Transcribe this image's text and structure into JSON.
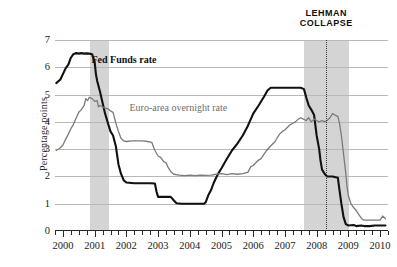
{
  "chart_data": {
    "type": "line",
    "title": "",
    "xlabel": "",
    "ylabel": "Percentage points",
    "xlim": [
      1999.75,
      2010.25
    ],
    "ylim": [
      0,
      7
    ],
    "ytick_labels": [
      "0",
      "1",
      "2",
      "3",
      "4",
      "5",
      "6",
      "7"
    ],
    "ytick_values": [
      0,
      1,
      2,
      3,
      4,
      5,
      6,
      7
    ],
    "xtick_labels": [
      "2000",
      "2001",
      "2002",
      "2003",
      "2004",
      "2005",
      "2006",
      "2007",
      "2008",
      "2009",
      "2010"
    ],
    "xtick_values": [
      2000,
      2001,
      2002,
      2003,
      2004,
      2005,
      2006,
      2007,
      2008,
      2009,
      2010
    ],
    "grid": true,
    "legend": "inline-labels",
    "series": [
      {
        "name": "Fed Funds rate",
        "color": "#111111",
        "label_x": 2000.9,
        "label_y": 6.25,
        "points": [
          [
            1999.79,
            5.42
          ],
          [
            1999.92,
            5.55
          ],
          [
            2000.0,
            5.75
          ],
          [
            2000.08,
            5.95
          ],
          [
            2000.17,
            6.1
          ],
          [
            2000.25,
            6.35
          ],
          [
            2000.33,
            6.48
          ],
          [
            2000.42,
            6.52
          ],
          [
            2000.5,
            6.5
          ],
          [
            2000.58,
            6.52
          ],
          [
            2000.67,
            6.5
          ],
          [
            2000.75,
            6.51
          ],
          [
            2000.83,
            6.5
          ],
          [
            2000.92,
            6.48
          ],
          [
            2001.0,
            6.2
          ],
          [
            2001.04,
            5.75
          ],
          [
            2001.08,
            5.5
          ],
          [
            2001.17,
            5.1
          ],
          [
            2001.25,
            4.7
          ],
          [
            2001.33,
            4.3
          ],
          [
            2001.42,
            3.95
          ],
          [
            2001.5,
            3.65
          ],
          [
            2001.58,
            3.5
          ],
          [
            2001.67,
            3.1
          ],
          [
            2001.75,
            2.45
          ],
          [
            2001.83,
            2.1
          ],
          [
            2001.92,
            1.85
          ],
          [
            2002.0,
            1.78
          ],
          [
            2002.25,
            1.75
          ],
          [
            2002.5,
            1.75
          ],
          [
            2002.75,
            1.75
          ],
          [
            2002.9,
            1.74
          ],
          [
            2002.95,
            1.45
          ],
          [
            2003.0,
            1.25
          ],
          [
            2003.1,
            1.25
          ],
          [
            2003.2,
            1.25
          ],
          [
            2003.4,
            1.25
          ],
          [
            2003.5,
            1.12
          ],
          [
            2003.58,
            1.02
          ],
          [
            2003.75,
            1.0
          ],
          [
            2004.0,
            1.0
          ],
          [
            2004.25,
            1.0
          ],
          [
            2004.45,
            1.0
          ],
          [
            2004.5,
            1.05
          ],
          [
            2004.58,
            1.3
          ],
          [
            2004.67,
            1.5
          ],
          [
            2004.75,
            1.75
          ],
          [
            2004.83,
            1.95
          ],
          [
            2004.92,
            2.15
          ],
          [
            2005.0,
            2.3
          ],
          [
            2005.17,
            2.65
          ],
          [
            2005.33,
            2.95
          ],
          [
            2005.5,
            3.2
          ],
          [
            2005.67,
            3.5
          ],
          [
            2005.83,
            3.85
          ],
          [
            2006.0,
            4.3
          ],
          [
            2006.17,
            4.6
          ],
          [
            2006.33,
            4.9
          ],
          [
            2006.45,
            5.15
          ],
          [
            2006.55,
            5.25
          ],
          [
            2006.75,
            5.25
          ],
          [
            2007.0,
            5.25
          ],
          [
            2007.25,
            5.25
          ],
          [
            2007.5,
            5.25
          ],
          [
            2007.6,
            5.2
          ],
          [
            2007.67,
            4.9
          ],
          [
            2007.75,
            4.6
          ],
          [
            2007.83,
            4.45
          ],
          [
            2007.92,
            4.25
          ],
          [
            2008.0,
            3.5
          ],
          [
            2008.08,
            3.0
          ],
          [
            2008.12,
            2.6
          ],
          [
            2008.17,
            2.25
          ],
          [
            2008.25,
            2.1
          ],
          [
            2008.33,
            2.0
          ],
          [
            2008.5,
            2.0
          ],
          [
            2008.67,
            1.95
          ],
          [
            2008.72,
            1.5
          ],
          [
            2008.78,
            1.0
          ],
          [
            2008.85,
            0.5
          ],
          [
            2008.92,
            0.25
          ],
          [
            2009.0,
            0.2
          ],
          [
            2009.17,
            0.22
          ],
          [
            2009.25,
            0.18
          ],
          [
            2009.4,
            0.2
          ],
          [
            2009.5,
            0.18
          ],
          [
            2009.67,
            0.18
          ],
          [
            2009.83,
            0.2
          ],
          [
            2010.0,
            0.2
          ],
          [
            2010.17,
            0.2
          ]
        ]
      },
      {
        "name": "Euro-area overnight rate",
        "color": "#7a7a7a",
        "label_x": 2002.1,
        "label_y": 4.5,
        "points": [
          [
            1999.79,
            2.95
          ],
          [
            1999.92,
            3.05
          ],
          [
            2000.0,
            3.15
          ],
          [
            2000.08,
            3.35
          ],
          [
            2000.17,
            3.55
          ],
          [
            2000.25,
            3.75
          ],
          [
            2000.33,
            3.9
          ],
          [
            2000.42,
            4.15
          ],
          [
            2000.5,
            4.35
          ],
          [
            2000.58,
            4.45
          ],
          [
            2000.67,
            4.6
          ],
          [
            2000.72,
            4.85
          ],
          [
            2000.78,
            4.78
          ],
          [
            2000.83,
            4.9
          ],
          [
            2000.92,
            4.85
          ],
          [
            2001.0,
            4.75
          ],
          [
            2001.08,
            4.78
          ],
          [
            2001.12,
            4.55
          ],
          [
            2001.17,
            4.6
          ],
          [
            2001.25,
            4.55
          ],
          [
            2001.33,
            4.5
          ],
          [
            2001.42,
            4.48
          ],
          [
            2001.5,
            4.4
          ],
          [
            2001.58,
            4.35
          ],
          [
            2001.67,
            3.95
          ],
          [
            2001.75,
            3.65
          ],
          [
            2001.83,
            3.4
          ],
          [
            2001.92,
            3.3
          ],
          [
            2002.0,
            3.28
          ],
          [
            2002.17,
            3.3
          ],
          [
            2002.33,
            3.3
          ],
          [
            2002.5,
            3.3
          ],
          [
            2002.67,
            3.28
          ],
          [
            2002.8,
            3.25
          ],
          [
            2002.9,
            2.95
          ],
          [
            2003.0,
            2.75
          ],
          [
            2003.08,
            2.7
          ],
          [
            2003.17,
            2.55
          ],
          [
            2003.25,
            2.5
          ],
          [
            2003.33,
            2.3
          ],
          [
            2003.42,
            2.15
          ],
          [
            2003.5,
            2.08
          ],
          [
            2003.67,
            2.05
          ],
          [
            2003.83,
            2.03
          ],
          [
            2004.0,
            2.05
          ],
          [
            2004.17,
            2.03
          ],
          [
            2004.33,
            2.05
          ],
          [
            2004.5,
            2.04
          ],
          [
            2004.67,
            2.05
          ],
          [
            2004.83,
            2.08
          ],
          [
            2005.0,
            2.1
          ],
          [
            2005.17,
            2.07
          ],
          [
            2005.33,
            2.1
          ],
          [
            2005.5,
            2.08
          ],
          [
            2005.67,
            2.1
          ],
          [
            2005.83,
            2.15
          ],
          [
            2005.92,
            2.35
          ],
          [
            2006.0,
            2.4
          ],
          [
            2006.08,
            2.5
          ],
          [
            2006.17,
            2.6
          ],
          [
            2006.25,
            2.65
          ],
          [
            2006.33,
            2.8
          ],
          [
            2006.42,
            2.95
          ],
          [
            2006.5,
            3.05
          ],
          [
            2006.58,
            3.15
          ],
          [
            2006.67,
            3.25
          ],
          [
            2006.75,
            3.4
          ],
          [
            2006.83,
            3.55
          ],
          [
            2006.92,
            3.65
          ],
          [
            2007.0,
            3.7
          ],
          [
            2007.08,
            3.8
          ],
          [
            2007.17,
            3.9
          ],
          [
            2007.25,
            3.95
          ],
          [
            2007.33,
            4.0
          ],
          [
            2007.42,
            4.1
          ],
          [
            2007.5,
            4.15
          ],
          [
            2007.58,
            4.1
          ],
          [
            2007.67,
            4.05
          ],
          [
            2007.75,
            4.15
          ],
          [
            2007.83,
            4.0
          ],
          [
            2007.92,
            4.1
          ],
          [
            2008.0,
            4.05
          ],
          [
            2008.08,
            4.0
          ],
          [
            2008.17,
            4.05
          ],
          [
            2008.25,
            4.0
          ],
          [
            2008.33,
            4.05
          ],
          [
            2008.42,
            4.15
          ],
          [
            2008.5,
            4.3
          ],
          [
            2008.58,
            4.25
          ],
          [
            2008.67,
            4.2
          ],
          [
            2008.72,
            3.95
          ],
          [
            2008.78,
            3.5
          ],
          [
            2008.83,
            3.0
          ],
          [
            2008.88,
            2.5
          ],
          [
            2008.92,
            2.1
          ],
          [
            2008.96,
            1.6
          ],
          [
            2009.0,
            1.3
          ],
          [
            2009.08,
            1.0
          ],
          [
            2009.17,
            0.85
          ],
          [
            2009.25,
            0.75
          ],
          [
            2009.33,
            0.6
          ],
          [
            2009.42,
            0.45
          ],
          [
            2009.5,
            0.4
          ],
          [
            2009.67,
            0.4
          ],
          [
            2009.83,
            0.4
          ],
          [
            2010.0,
            0.4
          ],
          [
            2010.08,
            0.55
          ],
          [
            2010.17,
            0.45
          ]
        ]
      }
    ],
    "shaded_bands": [
      {
        "name": "recession-2001",
        "x0": 2000.86,
        "x1": 2001.45,
        "color": "#d4d4d4"
      },
      {
        "name": "recession-2008",
        "x0": 2007.59,
        "x1": 2009.03,
        "color": "#d4d4d4"
      }
    ],
    "annotations": [
      {
        "name": "lehman-collapse",
        "text_line1": "LEHMAN",
        "text_line2": "COLLAPSE",
        "x": 2008.3
      }
    ]
  }
}
